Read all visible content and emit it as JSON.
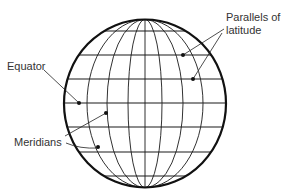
{
  "diagram": {
    "labels": {
      "parallels_line1": "Parallels of",
      "parallels_line2": "latitude",
      "equator": "Equator",
      "meridians": "Meridians"
    },
    "colors": {
      "ink": "#1a1a1a",
      "text": "#333333",
      "background": "#ffffff"
    },
    "globe": {
      "center": [
        145,
        103
      ],
      "radius_x": 81,
      "radius_y": 84,
      "parallels_y": [
        31,
        55,
        79,
        103,
        127,
        152,
        176
      ],
      "meridian_half_widths": [
        0,
        17,
        38,
        58
      ]
    }
  }
}
